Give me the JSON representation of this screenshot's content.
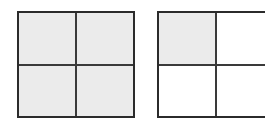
{
  "figure": {
    "type": "fraction-area-models",
    "background_color": "#ffffff",
    "shade_color": "#ebebeb",
    "border_color": "#2b2b2b",
    "divider_color": "#3a3a3a",
    "models": [
      {
        "id": "left",
        "name": "left-area-model",
        "rows": 2,
        "columns": 2,
        "total_parts": 4,
        "shaded_parts": 4,
        "fraction": "4/4",
        "clipped": false,
        "quadrants": [
          {
            "position": "top-left",
            "shaded": true
          },
          {
            "position": "top-right",
            "shaded": true
          },
          {
            "position": "bottom-left",
            "shaded": true
          },
          {
            "position": "bottom-right",
            "shaded": true
          }
        ]
      },
      {
        "id": "right",
        "name": "right-area-model",
        "rows": 2,
        "columns": 2,
        "total_parts": 4,
        "shaded_parts": 1,
        "fraction": "1/4",
        "clipped": true,
        "quadrants": [
          {
            "position": "top-left",
            "shaded": true
          },
          {
            "position": "top-right",
            "shaded": false
          },
          {
            "position": "bottom-left",
            "shaded": false
          },
          {
            "position": "bottom-right",
            "shaded": false
          }
        ]
      }
    ]
  }
}
